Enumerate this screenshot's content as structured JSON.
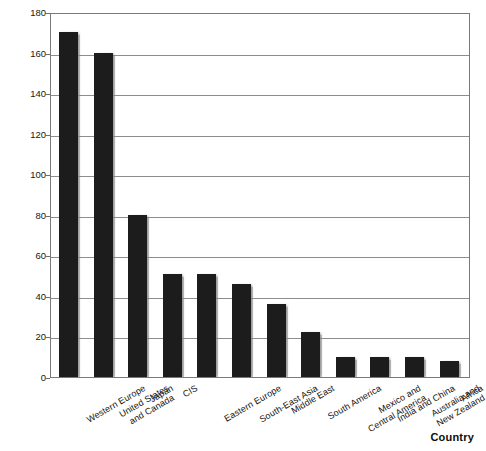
{
  "chart_data": {
    "type": "bar",
    "title": "",
    "subtitle": "",
    "xlabel": "Country",
    "ylabel": "",
    "ylim": [
      0,
      180
    ],
    "ytick_step": 20,
    "yticks": [
      0,
      20,
      40,
      60,
      80,
      100,
      120,
      140,
      160,
      180
    ],
    "grid": true,
    "legend": false,
    "legend_position": "none",
    "bar_color": "#1c1c1c",
    "categories": [
      "Western Europe",
      "United States\nand Canada",
      "Japan",
      "CIS",
      "Eastern Europe",
      "South-East Asia",
      "Middle East",
      "South America",
      "Mexico and\nCentral America",
      "India and China",
      "Australia and\nNew Zealand",
      "Africa"
    ],
    "values": [
      170,
      160,
      80,
      51,
      51,
      46,
      36,
      22,
      10,
      10,
      10,
      8
    ]
  },
  "colors": {
    "bar": "#1c1c1c",
    "grid": "#8d8d8d",
    "frame": "#7a7a7a",
    "text": "#141414",
    "background": "#ffffff"
  }
}
